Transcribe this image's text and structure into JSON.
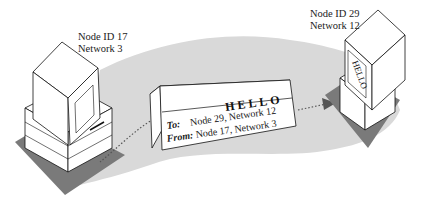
{
  "diagram": {
    "sender": {
      "node_label": "Node ID 17",
      "network_label": "Network 3"
    },
    "receiver": {
      "node_label": "Node ID 29",
      "network_label": "Network 12",
      "screen_text": "HELLO"
    },
    "packet": {
      "title": "HELLO",
      "to_label": "To:",
      "to_value": "Node 29, Network 12",
      "from_label": "From:",
      "from_value": "Node 17, Network 3"
    },
    "colors": {
      "path_band": "#d9d9d9",
      "shadow": "#7a7a7a",
      "outline": "#111111",
      "fill": "#ffffff"
    }
  }
}
